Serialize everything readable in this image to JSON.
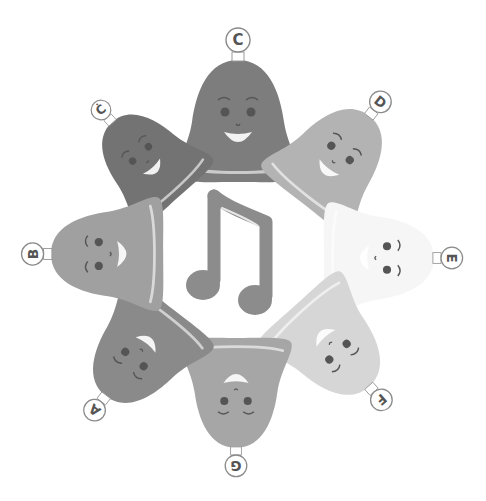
{
  "scene": {
    "description": "Eight bell-shaped singing characters arranged in a circle around a musical note",
    "center_icon": "eighth-note-pair-icon",
    "colors": {
      "background": "#ffffff",
      "note": "#8c8c8c",
      "label_ring": "#8a8a8a",
      "label_text": "#555555",
      "eye": "#555555"
    }
  },
  "bells": [
    {
      "id": "C",
      "label": "C",
      "x": 238,
      "y": 122,
      "rot": 0,
      "color": "#7d7d7d",
      "size": 1.0
    },
    {
      "id": "C2",
      "label": "Ċ",
      "x": 146,
      "y": 160,
      "rot": -42,
      "color": "#737373",
      "size": 0.82
    },
    {
      "id": "D",
      "label": "D",
      "x": 335,
      "y": 160,
      "rot": 38,
      "color": "#b3b3b3",
      "size": 0.9
    },
    {
      "id": "E",
      "label": "E",
      "x": 378,
      "y": 258,
      "rot": 90,
      "color": "#f6f6f6",
      "size": 0.9
    },
    {
      "id": "F",
      "label": "F",
      "x": 332,
      "y": 345,
      "rot": 138,
      "color": "#d6d6d6",
      "size": 0.9
    },
    {
      "id": "G",
      "label": "G",
      "x": 236,
      "y": 392,
      "rot": 180,
      "color": "#a6a6a6",
      "size": 0.9
    },
    {
      "id": "A",
      "label": "A",
      "x": 140,
      "y": 352,
      "rot": -142,
      "color": "#8a8a8a",
      "size": 0.9
    },
    {
      "id": "B",
      "label": "B",
      "x": 108,
      "y": 254,
      "rot": -90,
      "color": "#a0a0a0",
      "size": 0.92
    }
  ]
}
